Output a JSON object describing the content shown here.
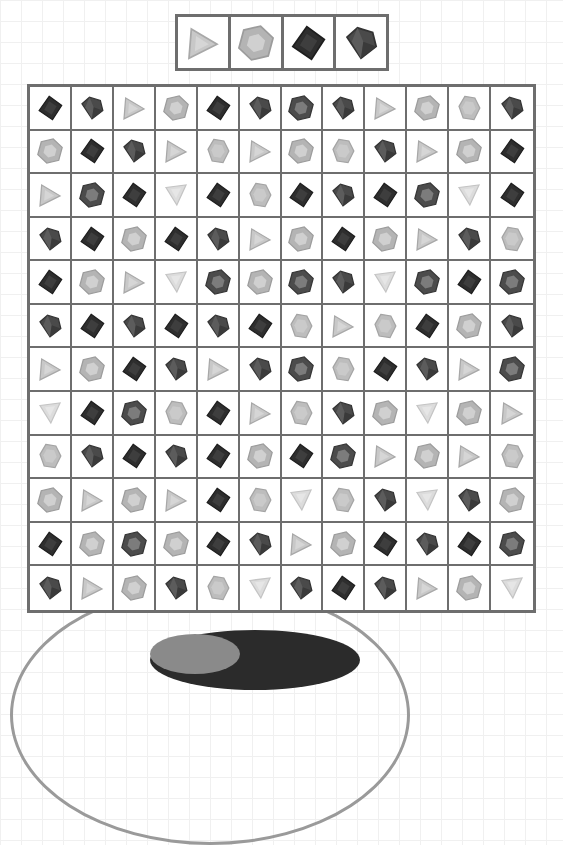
{
  "game": {
    "type": "gem-matching-grid",
    "rows": 12,
    "cols": 12
  },
  "gem_types": {
    "T": {
      "name": "light-triangle",
      "fill": "#c8c8c8",
      "stroke": "#a8a8a8",
      "inner": "#d6d6d6"
    },
    "Tv": {
      "name": "light-triangle-inverted",
      "fill": "#dcdcdc",
      "stroke": "#c4c4c4",
      "inner": "#e6e6e6"
    },
    "H": {
      "name": "light-hexagon",
      "fill": "#b4b4b4",
      "stroke": "#9c9c9c",
      "inner": "#d0d0d0"
    },
    "G": {
      "name": "light-gem",
      "fill": "#bdbdbd",
      "stroke": "#a4a4a4",
      "inner": "#cacaca"
    },
    "S": {
      "name": "dark-square",
      "fill": "#2e2e2e",
      "stroke": "#1e1e1e",
      "inner": "#3e3e3e"
    },
    "P": {
      "name": "dark-pentagon-gem",
      "fill": "#4a4a4a",
      "stroke": "#333333",
      "inner": "#5c5c5c"
    },
    "D": {
      "name": "dark-hexagon",
      "fill": "#4c4c4c",
      "stroke": "#363636",
      "inner": "#7c7c7c"
    }
  },
  "target_pieces": [
    "T",
    "H",
    "S",
    "P"
  ],
  "board": [
    [
      "S",
      "P",
      "T",
      "H",
      "S",
      "P",
      "D",
      "P",
      "T",
      "H",
      "G",
      "P"
    ],
    [
      "H",
      "S",
      "P",
      "T",
      "G",
      "T",
      "H",
      "G",
      "P",
      "T",
      "H",
      "S"
    ],
    [
      "T",
      "D",
      "S",
      "Tv",
      "S",
      "G",
      "S",
      "P",
      "S",
      "D",
      "Tv",
      "S"
    ],
    [
      "P",
      "S",
      "H",
      "S",
      "P",
      "T",
      "H",
      "S",
      "H",
      "T",
      "P",
      "G"
    ],
    [
      "S",
      "H",
      "T",
      "Tv",
      "D",
      "H",
      "D",
      "P",
      "Tv",
      "D",
      "S",
      "D"
    ],
    [
      "P",
      "S",
      "P",
      "S",
      "P",
      "S",
      "G",
      "T",
      "G",
      "S",
      "H",
      "P"
    ],
    [
      "T",
      "H",
      "S",
      "P",
      "T",
      "P",
      "D",
      "G",
      "S",
      "P",
      "T",
      "D"
    ],
    [
      "Tv",
      "S",
      "D",
      "G",
      "S",
      "T",
      "G",
      "P",
      "H",
      "Tv",
      "H",
      "T"
    ],
    [
      "G",
      "P",
      "S",
      "P",
      "S",
      "H",
      "S",
      "D",
      "T",
      "H",
      "T",
      "G"
    ],
    [
      "H",
      "T",
      "H",
      "T",
      "S",
      "G",
      "Tv",
      "G",
      "P",
      "Tv",
      "P",
      "H"
    ],
    [
      "S",
      "H",
      "D",
      "H",
      "S",
      "P",
      "T",
      "H",
      "S",
      "P",
      "S",
      "D"
    ],
    [
      "P",
      "T",
      "H",
      "P",
      "G",
      "Tv",
      "P",
      "S",
      "P",
      "T",
      "H",
      "Tv"
    ]
  ],
  "colors": {
    "border": "#6e6e6e",
    "background_grid": "#f0f0f0",
    "arc": "#9a9a9a"
  }
}
